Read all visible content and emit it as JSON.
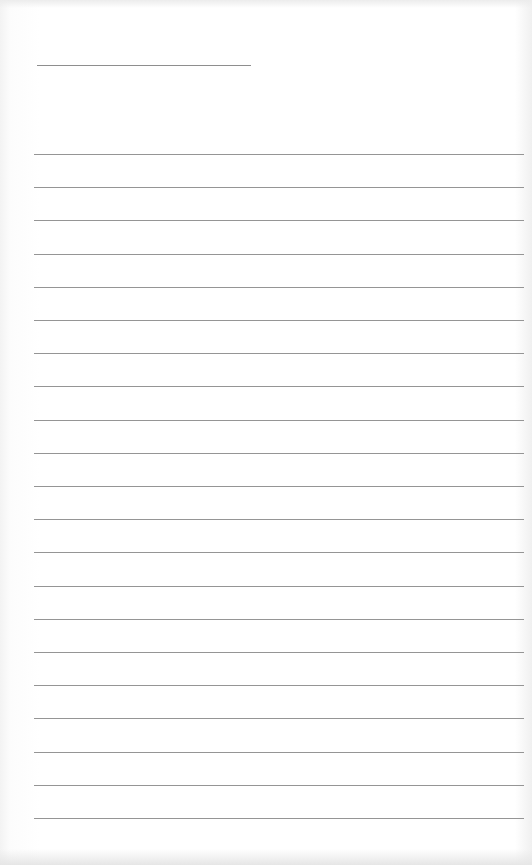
{
  "document": {
    "type": "lined-paper",
    "header": {
      "name_line": ""
    },
    "ruled_lines": {
      "count": 21,
      "first_y": 154,
      "spacing": 33.2,
      "color": "#959595",
      "contents": [
        "",
        "",
        "",
        "",
        "",
        "",
        "",
        "",
        "",
        "",
        "",
        "",
        "",
        "",
        "",
        "",
        "",
        "",
        "",
        "",
        ""
      ]
    },
    "background_color": "#ffffff"
  }
}
